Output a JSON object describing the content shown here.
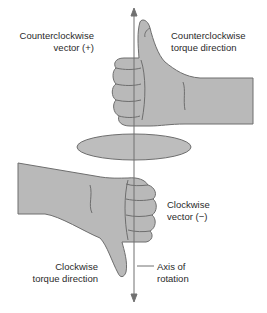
{
  "figure": {
    "labels": {
      "ccw_vector_line1": "Counterclockwise",
      "ccw_vector_line2": "vector (+)",
      "ccw_torque_line1": "Counterclockwise",
      "ccw_torque_line2": "torque direction",
      "cw_vector_line1": "Clockwise",
      "cw_vector_line2": "vector (−)",
      "cw_torque_line1": "Clockwise",
      "cw_torque_line2": "torque direction",
      "axis_line1": "Axis of",
      "axis_line2": "rotation"
    },
    "colors": {
      "hand_fill": "#b9b9b9",
      "outline": "#6e6e6e",
      "disc_fill": "#bdbdbd",
      "axis": "#707070"
    }
  }
}
